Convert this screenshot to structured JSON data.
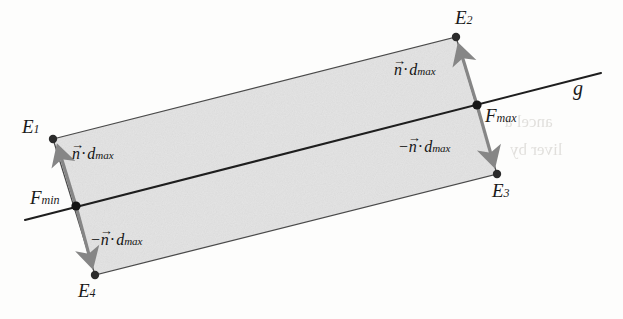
{
  "figure": {
    "background_color": "#fdfdfc",
    "fill_color": "#e3e3e3",
    "edge_color": "#3a3a3a",
    "line_color": "#1e1e1e",
    "arrow_color": "#868686",
    "dot_color": "#2b2b2b"
  },
  "points": {
    "e1": {
      "label": "E",
      "sub": "1",
      "x": 53,
      "y": 139
    },
    "e2": {
      "label": "E",
      "sub": "2",
      "x": 456,
      "y": 37
    },
    "e3": {
      "label": "E",
      "sub": "3",
      "x": 497,
      "y": 174
    },
    "e4": {
      "label": "E",
      "sub": "4",
      "x": 95,
      "y": 275
    },
    "fmin": {
      "label": "F",
      "sub": "min",
      "x": 76,
      "y": 206
    },
    "fmax": {
      "label": "F",
      "sub": "max",
      "x": 477,
      "y": 105
    }
  },
  "line": {
    "name": "g",
    "label": "g",
    "x1": 25,
    "y1": 220,
    "x2": 601,
    "y2": 73
  },
  "vectors": [
    {
      "id": "n-dmax-left",
      "sign": "",
      "n": "n",
      "dot": "·",
      "d": "d",
      "sub": "max",
      "from_point": "fmin",
      "to_point": "e1"
    },
    {
      "id": "minus-n-dmax-left",
      "sign": "−",
      "n": "n",
      "dot": "·",
      "d": "d",
      "sub": "max",
      "from_point": "fmin",
      "to_point": "e4"
    },
    {
      "id": "n-dmax-right",
      "sign": "",
      "n": "n",
      "dot": "·",
      "d": "d",
      "sub": "max",
      "from_point": "fmax",
      "to_point": "e2"
    },
    {
      "id": "minus-n-dmax-right",
      "sign": "−",
      "n": "n",
      "dot": "·",
      "d": "d",
      "sub": "max",
      "from_point": "fmax",
      "to_point": "e3"
    }
  ],
  "ghost_text": {
    "right_upper": "ancel a",
    "right_lower": "liver by"
  }
}
